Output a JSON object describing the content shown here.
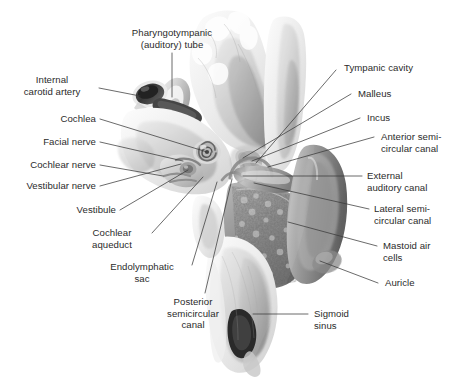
{
  "figure": {
    "width": 462,
    "height": 387,
    "background_color": "#ffffff",
    "label_text_color": "#2b2b2b",
    "leader_line_color": "#3a3a3a",
    "illustration_style": "grayscale medical airbrush illustration"
  },
  "labels": [
    {
      "id": "pharyngotympanic-tube",
      "text": "Pharyngotympanic\n(auditory) tube",
      "side": "center",
      "x": 113,
      "y": 27,
      "w": 118,
      "align": "center",
      "leader": {
        "from": [
          172,
          53
        ],
        "to": [
          172,
          97
        ]
      }
    },
    {
      "id": "internal-carotid-artery",
      "text": "Internal\ncarotid artery",
      "side": "left",
      "x": 8,
      "y": 74,
      "w": 88,
      "align": "center",
      "leader": {
        "from": [
          99,
          88
        ],
        "to": [
          140,
          96
        ]
      }
    },
    {
      "id": "cochlea",
      "text": "Cochlea",
      "side": "left",
      "x": 26,
      "y": 113,
      "w": 70,
      "align": "right",
      "leader": {
        "from": [
          100,
          119
        ],
        "to": [
          207,
          152
        ]
      }
    },
    {
      "id": "facial-nerve",
      "text": "Facial nerve",
      "side": "left",
      "x": 16,
      "y": 136,
      "w": 80,
      "align": "right",
      "leader": {
        "from": [
          100,
          142
        ],
        "to": [
          183,
          161
        ]
      }
    },
    {
      "id": "cochlear-nerve",
      "text": "Cochlear nerve",
      "side": "left",
      "x": 6,
      "y": 159,
      "w": 90,
      "align": "right",
      "leader": {
        "from": [
          100,
          165
        ],
        "to": [
          163,
          176
        ]
      }
    },
    {
      "id": "vestibular-nerve",
      "text": "Vestibular nerve",
      "side": "left",
      "x": 2,
      "y": 180,
      "w": 94,
      "align": "right",
      "leader": {
        "from": [
          100,
          186
        ],
        "to": [
          181,
          164
        ]
      }
    },
    {
      "id": "vestibule",
      "text": "Vestibule",
      "side": "left",
      "x": 46,
      "y": 204,
      "w": 70,
      "align": "right",
      "leader": {
        "from": [
          120,
          210
        ],
        "to": [
          188,
          170
        ]
      }
    },
    {
      "id": "cochlear-aqueduct",
      "text": "Cochlear\naqueduct",
      "side": "left",
      "x": 76,
      "y": 227,
      "w": 72,
      "align": "center",
      "leader": {
        "from": [
          152,
          233
        ],
        "to": [
          203,
          177
        ]
      }
    },
    {
      "id": "endolymphatic-sac",
      "text": "Endolymphatic\nsac",
      "side": "left",
      "x": 96,
      "y": 261,
      "w": 92,
      "align": "center",
      "leader": {
        "from": [
          192,
          265
        ],
        "to": [
          217,
          182
        ]
      }
    },
    {
      "id": "posterior-semicircular-canal",
      "text": "Posterior\nsemicircular\ncanal",
      "side": "left",
      "x": 152,
      "y": 296,
      "w": 82,
      "align": "center",
      "leader": {
        "from": [
          205,
          293
        ],
        "to": [
          232,
          179
        ]
      }
    },
    {
      "id": "tympanic-cavity",
      "text": "Tympanic cavity",
      "side": "right",
      "x": 344,
      "y": 62,
      "w": 110,
      "align": "left",
      "leader": {
        "from": [
          336,
          70
        ],
        "to": [
          256,
          163
        ]
      }
    },
    {
      "id": "malleus",
      "text": "Malleus",
      "side": "right",
      "x": 358,
      "y": 88,
      "w": 80,
      "align": "left",
      "leader": {
        "from": [
          351,
          94
        ],
        "to": [
          243,
          158
        ]
      }
    },
    {
      "id": "incus",
      "text": "Incus",
      "side": "right",
      "x": 367,
      "y": 112,
      "w": 70,
      "align": "left",
      "leader": {
        "from": [
          360,
          118
        ],
        "to": [
          252,
          161
        ]
      }
    },
    {
      "id": "anterior-semicircular-canal",
      "text": "Anterior semi-\ncircular canal",
      "side": "right",
      "x": 381,
      "y": 131,
      "w": 80,
      "align": "left",
      "leader": {
        "from": [
          374,
          137
        ],
        "to": [
          268,
          167
        ]
      }
    },
    {
      "id": "external-auditory-canal",
      "text": "External\nauditory canal",
      "side": "right",
      "x": 367,
      "y": 170,
      "w": 94,
      "align": "left",
      "leader": {
        "from": [
          362,
          176
        ],
        "to": [
          243,
          176
        ]
      }
    },
    {
      "id": "lateral-semicircular-canal",
      "text": "Lateral semi-\ncircular canal",
      "side": "right",
      "x": 374,
      "y": 203,
      "w": 84,
      "align": "left",
      "leader": {
        "from": [
          369,
          209
        ],
        "to": [
          254,
          183
        ]
      }
    },
    {
      "id": "mastoid-air-cells",
      "text": "Mastoid air\ncells",
      "side": "right",
      "x": 383,
      "y": 240,
      "w": 76,
      "align": "left",
      "leader": {
        "from": [
          377,
          246
        ],
        "to": [
          288,
          222
        ]
      }
    },
    {
      "id": "auricle",
      "text": "Auricle",
      "side": "right",
      "x": 385,
      "y": 277,
      "w": 70,
      "align": "left",
      "leader": {
        "from": [
          378,
          283
        ],
        "to": [
          320,
          261
        ]
      }
    },
    {
      "id": "sigmoid-sinus",
      "text": "Sigmoid\nsinus",
      "side": "right",
      "x": 314,
      "y": 308,
      "w": 66,
      "align": "left",
      "leader": {
        "from": [
          308,
          314
        ],
        "to": [
          253,
          314
        ]
      }
    }
  ]
}
